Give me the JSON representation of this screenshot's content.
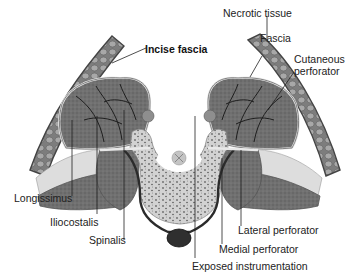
{
  "figure": {
    "type": "anatomical-cross-section",
    "colors": {
      "background": "#ffffff",
      "muscle": "#6f6f6f",
      "muscle_dark": "#4a4a4a",
      "skin_fat": "#8a8a8a",
      "fat_globules": "#a9a9a9",
      "bone": "#cfcfcf",
      "fascia": "#e3e3e3",
      "vessel": "#1e1e1e",
      "instrumentation": "#2b2b2b",
      "label_text": "#222222",
      "leader_line": "#222222"
    }
  },
  "labels": {
    "incise_fascia": "Incise fascia",
    "necrotic_tissue": "Necrotic tissue",
    "fascia": "Fascia",
    "cutaneous_perforator_line1": "Cutaneous",
    "cutaneous_perforator_line2": "perforator",
    "longissimus": "Longissimus",
    "iliocostalis": "Iliocostalis",
    "spinalis": "Spinalis",
    "lateral_perforator": "Lateral perforator",
    "medial_perforator": "Medial perforator",
    "exposed_instrumentation": "Exposed instrumentation"
  }
}
